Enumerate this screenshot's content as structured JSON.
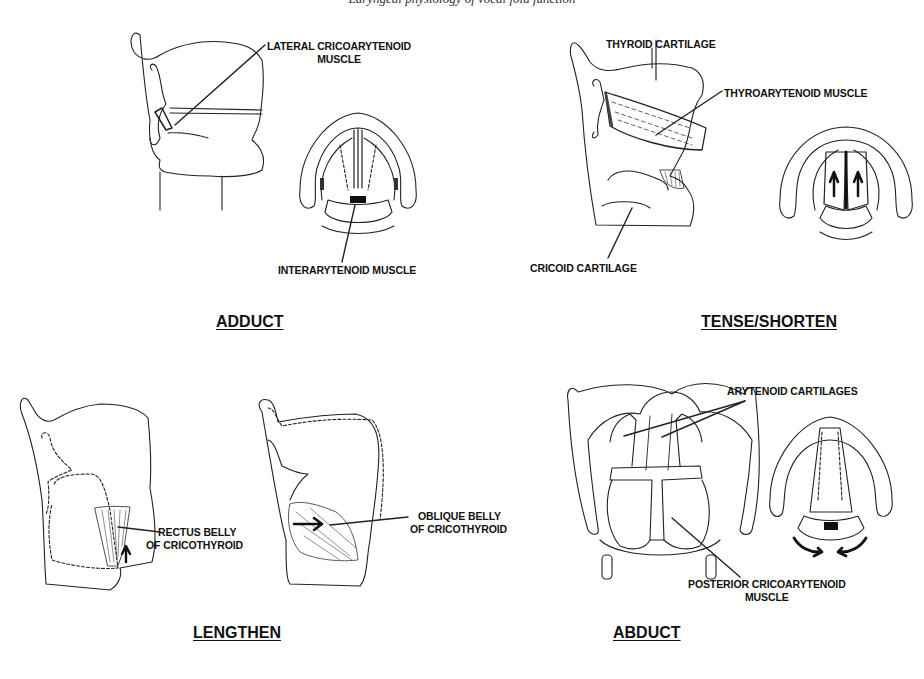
{
  "caption": "Laryngeal physiology of vocal fold function",
  "panels": [
    {
      "id": "adduct",
      "title": "ADDUCT",
      "labels": [
        "LATERAL CRICOARYTENOID MUSCLE",
        "INTERARYTENOID MUSCLE"
      ]
    },
    {
      "id": "tense-shorten",
      "title": "TENSE/SHORTEN",
      "labels": [
        "THYROID CARTILAGE",
        "THYROARYTENOID MUSCLE",
        "CRICOID CARTILAGE"
      ]
    },
    {
      "id": "lengthen",
      "title": "LENGTHEN",
      "labels": [
        "RECTUS BELLY OF CRICOTHYROID",
        "OBLIQUE BELLY OF CRICOTHYROID"
      ]
    },
    {
      "id": "abduct",
      "title": "ABDUCT",
      "labels": [
        "ARYTENOID CARTILAGES",
        "POSTERIOR CRICOARYTENOID MUSCLE"
      ]
    }
  ],
  "label_lines": {
    "lca_1": "LATERAL CRICOARYTENOID",
    "lca_2": "MUSCLE",
    "ia": "INTERARYTENOID MUSCLE",
    "thyroid": "THYROID CARTILAGE",
    "ta": "THYROARYTENOID MUSCLE",
    "cricoid": "CRICOID CARTILAGE",
    "rectus_1": "RECTUS BELLY",
    "rectus_2": "OF CRICOTHYROID",
    "oblique_1": "OBLIQUE BELLY",
    "oblique_2": "OF CRICOTHYROID",
    "aryt": "ARYTENOID CARTILAGES",
    "pca_1": "POSTERIOR CRICOARYTENOID",
    "pca_2": "MUSCLE"
  }
}
